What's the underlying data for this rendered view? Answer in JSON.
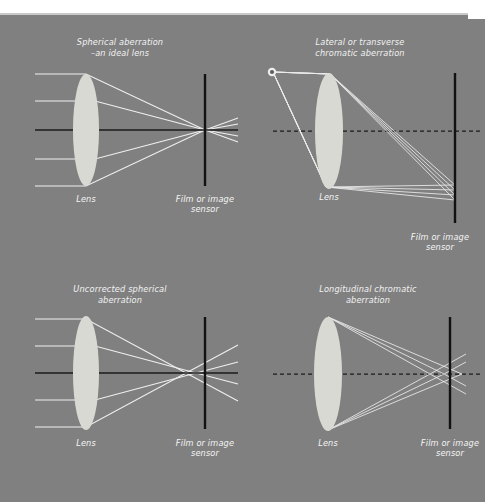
{
  "figure": {
    "background_color": "#808080",
    "top_margin_color": "#ffffff",
    "ray_color": "#f0f0f0",
    "lens_color": "#d9d9d4",
    "axis_color": "#1b1b1b",
    "caption_color": "#f2f2f2",
    "width": 485,
    "height": 502
  },
  "panels": [
    {
      "id": "spherical-ideal",
      "title_line1": "Spherical aberration",
      "title_line2": "–an ideal lens",
      "lens_label": "Lens",
      "film_label_line1": "Film or image",
      "film_label_line2": "sensor",
      "axis_style": "solid",
      "description": "Parallel rays converge to a single point exactly on the film plane."
    },
    {
      "id": "lateral-chromatic",
      "title_line1": "Lateral or transverse",
      "title_line2": "chromatic aberration",
      "lens_label": "Lens",
      "film_label_line1": "Film or image",
      "film_label_line2": "sensor",
      "axis_style": "dashed",
      "has_point_source": true,
      "description": "Off-axis point source; rays focus at different heights on the film plane."
    },
    {
      "id": "uncorrected-spherical",
      "title_line1": "Uncorrected spherical",
      "title_line2": "aberration",
      "lens_label": "Lens",
      "film_label_line1": "Film or image",
      "film_label_line2": "sensor",
      "axis_style": "solid",
      "description": "Marginal rays cross the axis before the film plane, producing a blur circle."
    },
    {
      "id": "longitudinal-chromatic",
      "title_line1": "Longitudinal chromatic",
      "title_line2": "aberration",
      "lens_label": "Lens",
      "film_label_line1": "Film or image",
      "film_label_line2": "sensor",
      "axis_style": "dashed",
      "description": "Different wavelengths focus at different distances along the optical axis."
    }
  ]
}
